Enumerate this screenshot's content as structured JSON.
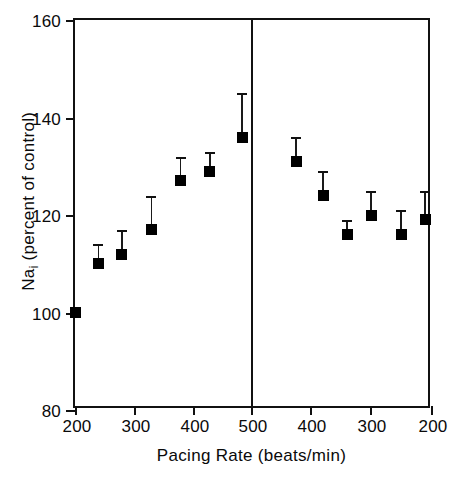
{
  "chart_data": {
    "type": "scatter",
    "title": "",
    "xlabel": "Pacing Rate  (beats/min)",
    "ylabel_main": "Na",
    "ylabel_sub": "i",
    "ylabel_rest": " (percent of control)",
    "ylabel_full": "Na_i (percent of control)",
    "ylim": [
      80,
      160
    ],
    "yticks": [
      80,
      100,
      120,
      140,
      160
    ],
    "xticks": [
      200,
      300,
      400,
      500,
      400,
      300,
      200
    ],
    "xtick_positions_px": [
      73,
      132,
      191,
      249,
      308,
      368,
      429
    ],
    "grid": false,
    "legend": "none",
    "marker_style": "filled-square",
    "error_bars": "upper only (SEM)",
    "phase_divider_at": "500 beats/min",
    "series": [
      {
        "name": "Na_i (percent of control)",
        "points": [
          {
            "phase": "ascending",
            "x": 200,
            "y": 100,
            "yerr_upper": 100
          },
          {
            "phase": "ascending",
            "x": 240,
            "y": 110,
            "yerr_upper": 114
          },
          {
            "phase": "ascending",
            "x": 280,
            "y": 112,
            "yerr_upper": 117
          },
          {
            "phase": "ascending",
            "x": 330,
            "y": 117,
            "yerr_upper": 124
          },
          {
            "phase": "ascending",
            "x": 380,
            "y": 127,
            "yerr_upper": 132
          },
          {
            "phase": "ascending",
            "x": 430,
            "y": 129,
            "yerr_upper": 133
          },
          {
            "phase": "ascending",
            "x": 485,
            "y": 136,
            "yerr_upper": 145
          },
          {
            "phase": "descending",
            "x": 515,
            "y": 136,
            "yerr_upper": 145
          },
          {
            "phase": "descending",
            "x": 425,
            "y": 131,
            "yerr_upper": 136
          },
          {
            "phase": "descending",
            "x": 380,
            "y": 124,
            "yerr_upper": 129
          },
          {
            "phase": "descending",
            "x": 340,
            "y": 116,
            "yerr_upper": 119
          },
          {
            "phase": "descending",
            "x": 300,
            "y": 120,
            "yerr_upper": 125
          },
          {
            "phase": "descending",
            "x": 250,
            "y": 116,
            "yerr_upper": 121
          },
          {
            "phase": "descending",
            "x": 210,
            "y": 119,
            "yerr_upper": 125
          }
        ]
      }
    ],
    "colors": {
      "marker": "#000000",
      "axis": "#111111",
      "background": "#ffffff"
    }
  }
}
